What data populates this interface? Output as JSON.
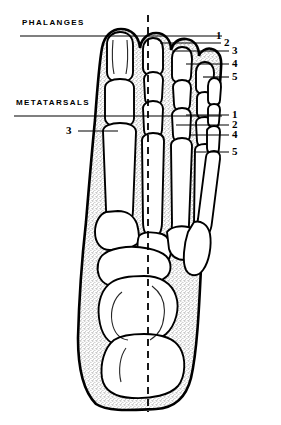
{
  "figure": {
    "background_color": "#ffffff",
    "ink_color": "#000000",
    "stipple_color": "#8a8a8a"
  },
  "section_labels": [
    {
      "name": "phalanges",
      "text": "PHALANGES",
      "x": 22,
      "y": 24,
      "rule_y": 36,
      "rule_x1": 20,
      "rule_x2": 222
    },
    {
      "name": "metatarsals",
      "text": "METATARSALS",
      "x": 16,
      "y": 104,
      "rule_y": 116,
      "rule_x1": 14,
      "rule_x2": 222
    }
  ],
  "phalange_numbers": [
    {
      "label": "1",
      "x": 216,
      "y": 29,
      "leader_x1": 152,
      "leader_x2": 213,
      "leader_y": 36
    },
    {
      "label": "2",
      "x": 224,
      "y": 36,
      "leader_x1": 160,
      "leader_x2": 221,
      "leader_y": 43
    },
    {
      "label": "3",
      "x": 232,
      "y": 44,
      "leader_x1": 172,
      "leader_x2": 229,
      "leader_y": 51
    },
    {
      "label": "4",
      "x": 232,
      "y": 57,
      "leader_x1": 186,
      "leader_x2": 229,
      "leader_y": 64
    },
    {
      "label": "5",
      "x": 232,
      "y": 70,
      "leader_x1": 203,
      "leader_x2": 229,
      "leader_y": 77
    }
  ],
  "metatarsal_numbers": [
    {
      "label": "1",
      "x": 232,
      "y": 108,
      "leader_x1": 186,
      "leader_x2": 229,
      "leader_y": 115
    },
    {
      "label": "2",
      "x": 232,
      "y": 118,
      "leader_x1": 176,
      "leader_x2": 229,
      "leader_y": 125
    },
    {
      "label": "4",
      "x": 232,
      "y": 128,
      "leader_x1": 190,
      "leader_x2": 229,
      "leader_y": 135
    },
    {
      "label": "5",
      "x": 232,
      "y": 145,
      "leader_x1": 196,
      "leader_x2": 229,
      "leader_y": 152
    },
    {
      "label": "3",
      "x": 66,
      "y": 124,
      "leader_x1": 78,
      "leader_x2": 118,
      "leader_y": 131,
      "side": "left"
    }
  ],
  "axis": {
    "name": "midline-axis",
    "style": "dashed",
    "x": 148,
    "y_top": 15,
    "y_bottom": 412
  }
}
